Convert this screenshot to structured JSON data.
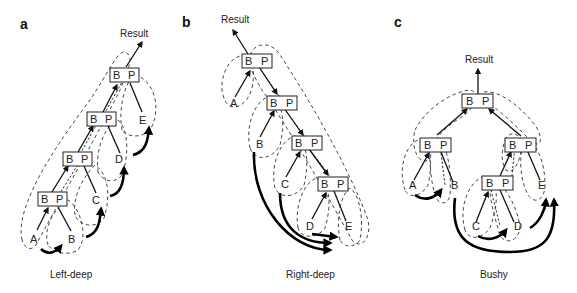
{
  "figure": {
    "panels": [
      {
        "letter": "a",
        "caption": "Left-deep",
        "result_label": "Result",
        "join_nodes": [
          {
            "build": "B",
            "probe": "P"
          },
          {
            "build": "B",
            "probe": "P"
          },
          {
            "build": "B",
            "probe": "P"
          },
          {
            "build": "B",
            "probe": "P"
          }
        ],
        "leaves": [
          "A",
          "B",
          "C",
          "D",
          "E"
        ]
      },
      {
        "letter": "b",
        "caption": "Right-deep",
        "result_label": "Result",
        "join_nodes": [
          {
            "build": "B",
            "probe": "P"
          },
          {
            "build": "B",
            "probe": "P"
          },
          {
            "build": "B",
            "probe": "P"
          },
          {
            "build": "B",
            "probe": "P"
          }
        ],
        "leaves": [
          "A",
          "B",
          "C",
          "D",
          "E"
        ]
      },
      {
        "letter": "c",
        "caption": "Bushy",
        "result_label": "Result",
        "join_nodes": [
          {
            "build": "B",
            "probe": "P"
          },
          {
            "build": "B",
            "probe": "P"
          },
          {
            "build": "B",
            "probe": "P"
          },
          {
            "build": "B",
            "probe": "P"
          }
        ],
        "leaves": [
          "A",
          "B",
          "C",
          "D",
          "E"
        ]
      }
    ]
  }
}
